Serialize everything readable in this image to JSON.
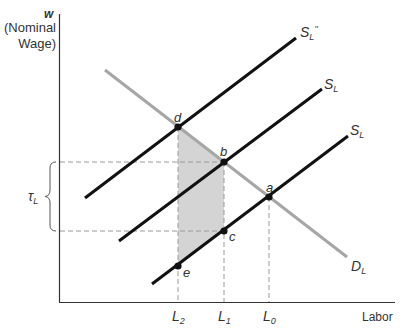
{
  "axes": {
    "y_label_symbol": "w",
    "y_label_line1": "(Nominal",
    "y_label_line2": "Wage)",
    "x_label": "Labor"
  },
  "curves": {
    "supply_shifted2": {
      "base": "S",
      "sub": "L",
      "sup": "''"
    },
    "supply_shifted1": {
      "base": "S",
      "sub": "L"
    },
    "supply_original": {
      "base": "S",
      "sub": "L"
    },
    "demand": {
      "base": "D",
      "sub": "L"
    }
  },
  "points": {
    "a": "a",
    "b": "b",
    "c": "c",
    "d": "d",
    "e": "e"
  },
  "x_ticks": [
    {
      "base": "L",
      "sub": "2"
    },
    {
      "base": "L",
      "sub": "1"
    },
    {
      "base": "L",
      "sub": "0"
    }
  ],
  "tax_brace": {
    "base": "τ",
    "sub": "L"
  },
  "colors": {
    "supply": "#111111",
    "demand": "#a6a6a6",
    "shaded_area": "#d4d4d4",
    "dashed": "#9a9a9a",
    "axis": "#333333"
  }
}
